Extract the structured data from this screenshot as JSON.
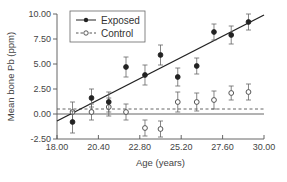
{
  "chart_data": {
    "type": "scatter",
    "title": "",
    "xlabel": "Age (years)",
    "ylabel": "Mean bone Pb (ppm)",
    "xlim": [
      18.0,
      30.0
    ],
    "ylim": [
      -2.5,
      10.0
    ],
    "x_ticks": [
      "18.00",
      "20.40",
      "22.80",
      "25.20",
      "27.60",
      "30.00"
    ],
    "y_ticks": [
      "-2.50",
      "0.00",
      "2.50",
      "5.00",
      "7.50",
      "10.00"
    ],
    "grid": false,
    "legend_position": "upper left",
    "series": [
      {
        "name": "Exposed",
        "marker": "filled-circle",
        "line": "solid",
        "x": [
          18.9,
          20.0,
          21.0,
          22.0,
          23.1,
          24.0,
          25.0,
          26.1,
          27.1,
          28.1,
          29.1
        ],
        "values": [
          -0.8,
          1.6,
          1.2,
          4.7,
          3.9,
          5.9,
          3.7,
          4.8,
          8.2,
          7.9,
          9.2
        ],
        "error": [
          1.1,
          0.9,
          1.0,
          1.0,
          1.0,
          1.0,
          0.9,
          0.8,
          0.8,
          0.9,
          0.8
        ],
        "fit_line": {
          "x": [
            18.0,
            30.0
          ],
          "y": [
            -0.7,
            9.9
          ]
        }
      },
      {
        "name": "Control",
        "marker": "open-circle",
        "line": "dashed",
        "x": [
          18.9,
          20.0,
          21.0,
          22.0,
          23.1,
          24.0,
          25.0,
          26.1,
          27.1,
          28.1,
          29.1
        ],
        "values": [
          0.2,
          0.2,
          0.7,
          0.2,
          -1.4,
          -1.5,
          1.2,
          1.2,
          1.4,
          2.1,
          2.2
        ],
        "error": [
          1.0,
          0.8,
          0.9,
          0.8,
          0.8,
          0.8,
          1.0,
          0.9,
          0.9,
          0.7,
          0.8
        ],
        "fit_line": {
          "x": [
            18.0,
            30.0
          ],
          "y": [
            0.5,
            0.5
          ]
        }
      }
    ],
    "reference_line": {
      "y": 0.0,
      "style": "solid"
    }
  },
  "legend": {
    "items": [
      {
        "label": "Exposed"
      },
      {
        "label": "Control"
      }
    ]
  },
  "colors": {
    "ink": "#222222",
    "axis": "#555555"
  }
}
